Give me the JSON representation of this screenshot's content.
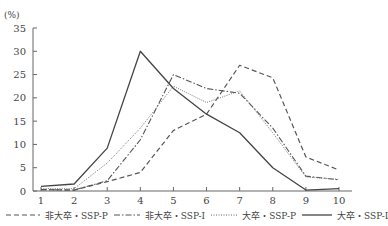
{
  "chart_data": {
    "type": "line",
    "title": "",
    "xlabel": "",
    "ylabel": "(%)",
    "x": [
      1,
      2,
      3,
      4,
      5,
      6,
      7,
      8,
      9,
      10
    ],
    "xlim": [
      1,
      10
    ],
    "ylim": [
      0,
      35
    ],
    "yticks": [
      0,
      5,
      10,
      15,
      20,
      25,
      30,
      35
    ],
    "grid": false,
    "legend_position": "bottom",
    "series": [
      {
        "name": "非大卒・SSP-P",
        "style": "dashed",
        "values": [
          0.3,
          0.2,
          2.0,
          4.0,
          13.0,
          16.5,
          27.0,
          24.3,
          7.3,
          4.5
        ]
      },
      {
        "name": "非大卒・SSP-I",
        "style": "dashdot",
        "values": [
          0.3,
          0.2,
          2.2,
          11.0,
          25.0,
          22.0,
          21.0,
          13.5,
          3.2,
          2.4
        ]
      },
      {
        "name": "大卒・SSP-P",
        "style": "dotted",
        "values": [
          0.5,
          0.5,
          6.0,
          13.5,
          22.5,
          19.0,
          21.5,
          12.5,
          3.0,
          2.5
        ]
      },
      {
        "name": "大卒・SSP-I",
        "style": "solid",
        "values": [
          1.0,
          1.5,
          9.2,
          30.0,
          22.0,
          16.5,
          12.5,
          5.0,
          0.2,
          0.5
        ]
      }
    ]
  },
  "axis": {
    "unit_label": "(%)",
    "y_tick_labels": [
      "0",
      "5",
      "10",
      "15",
      "20",
      "25",
      "30",
      "35"
    ],
    "x_tick_labels": [
      "1",
      "2",
      "3",
      "4",
      "5",
      "6",
      "7",
      "8",
      "9",
      "10"
    ]
  },
  "legend": [
    {
      "label": "非大卒・SSP-P",
      "style": "dashed"
    },
    {
      "label": "非大卒・SSP-I",
      "style": "dashdot"
    },
    {
      "label": "大卒・SSP-P",
      "style": "dotted"
    },
    {
      "label": "大卒・SSP-I",
      "style": "solid"
    }
  ]
}
